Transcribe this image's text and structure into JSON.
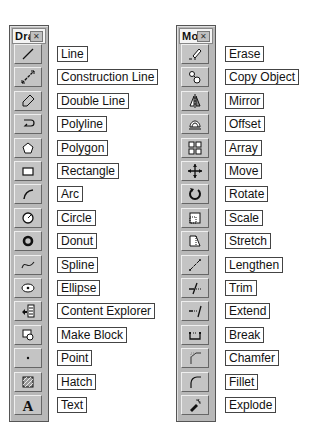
{
  "draw_toolbar": {
    "title": "Dra",
    "items": [
      {
        "label": "Line",
        "icon": "line-icon"
      },
      {
        "label": "Construction Line",
        "icon": "construction-line-icon"
      },
      {
        "label": "Double Line",
        "icon": "double-line-icon"
      },
      {
        "label": "Polyline",
        "icon": "polyline-icon"
      },
      {
        "label": "Polygon",
        "icon": "polygon-icon"
      },
      {
        "label": "Rectangle",
        "icon": "rectangle-icon"
      },
      {
        "label": "Arc",
        "icon": "arc-icon"
      },
      {
        "label": "Circle",
        "icon": "circle-icon"
      },
      {
        "label": "Donut",
        "icon": "donut-icon"
      },
      {
        "label": "Spline",
        "icon": "spline-icon"
      },
      {
        "label": "Ellipse",
        "icon": "ellipse-icon"
      },
      {
        "label": "Content Explorer",
        "icon": "content-explorer-icon"
      },
      {
        "label": "Make Block",
        "icon": "make-block-icon"
      },
      {
        "label": "Point",
        "icon": "point-icon"
      },
      {
        "label": "Hatch",
        "icon": "hatch-icon"
      },
      {
        "label": "Text",
        "icon": "text-icon"
      }
    ]
  },
  "modify_toolbar": {
    "title": "Mo",
    "items": [
      {
        "label": "Erase",
        "icon": "erase-icon"
      },
      {
        "label": "Copy Object",
        "icon": "copy-object-icon"
      },
      {
        "label": "Mirror",
        "icon": "mirror-icon"
      },
      {
        "label": "Offset",
        "icon": "offset-icon"
      },
      {
        "label": "Array",
        "icon": "array-icon"
      },
      {
        "label": "Move",
        "icon": "move-icon"
      },
      {
        "label": "Rotate",
        "icon": "rotate-icon"
      },
      {
        "label": "Scale",
        "icon": "scale-icon"
      },
      {
        "label": "Stretch",
        "icon": "stretch-icon"
      },
      {
        "label": "Lengthen",
        "icon": "lengthen-icon"
      },
      {
        "label": "Trim",
        "icon": "trim-icon"
      },
      {
        "label": "Extend",
        "icon": "extend-icon"
      },
      {
        "label": "Break",
        "icon": "break-icon"
      },
      {
        "label": "Chamfer",
        "icon": "chamfer-icon"
      },
      {
        "label": "Fillet",
        "icon": "fillet-icon"
      },
      {
        "label": "Explode",
        "icon": "explode-icon"
      }
    ]
  },
  "close_glyph": "✕"
}
